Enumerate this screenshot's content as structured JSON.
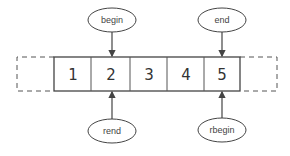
{
  "diagram": {
    "type": "iterator-diagram",
    "cells": [
      {
        "value": "1"
      },
      {
        "value": "2"
      },
      {
        "value": "3"
      },
      {
        "value": "4"
      },
      {
        "value": "5"
      }
    ],
    "sentinels": {
      "left": "dashed past-the-beginning slot",
      "right": "dashed past-the-end slot"
    },
    "pointers": {
      "begin": {
        "label": "begin",
        "target_cell": 1,
        "position": "top"
      },
      "end": {
        "label": "end",
        "target_cell": 4,
        "position": "top"
      },
      "rend": {
        "label": "rend",
        "target_cell": 1,
        "position": "bottom"
      },
      "rbegin": {
        "label": "rbegin",
        "target_cell": 4,
        "position": "bottom"
      }
    },
    "colors": {
      "stroke": "#444444",
      "text": "#333333",
      "background": "#ffffff"
    }
  }
}
